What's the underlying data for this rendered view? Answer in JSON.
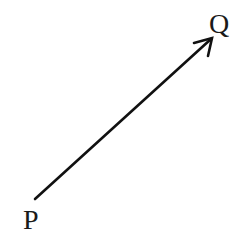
{
  "diagram": {
    "type": "vector",
    "start_label": "P",
    "end_label": "Q",
    "line_color": "#111111",
    "background": "#ffffff"
  }
}
